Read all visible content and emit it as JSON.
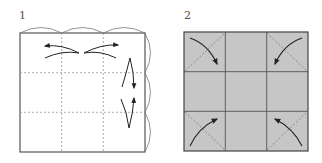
{
  "steps": [
    {
      "number": "1",
      "description": "Square with 3x3 dashed crease grid; top edge and right edge divided into three arcs; arrows show folding edges inward"
    },
    {
      "number": "2",
      "description": "Gray square with 3x3 grid; each corner cell has a dashed diagonal and a curved arrow pointing to fold corner in"
    }
  ],
  "colors": {
    "line": "#444444",
    "dashed": "#888888",
    "fill_step2": "#c6c6c6",
    "arrow": "#222222"
  }
}
